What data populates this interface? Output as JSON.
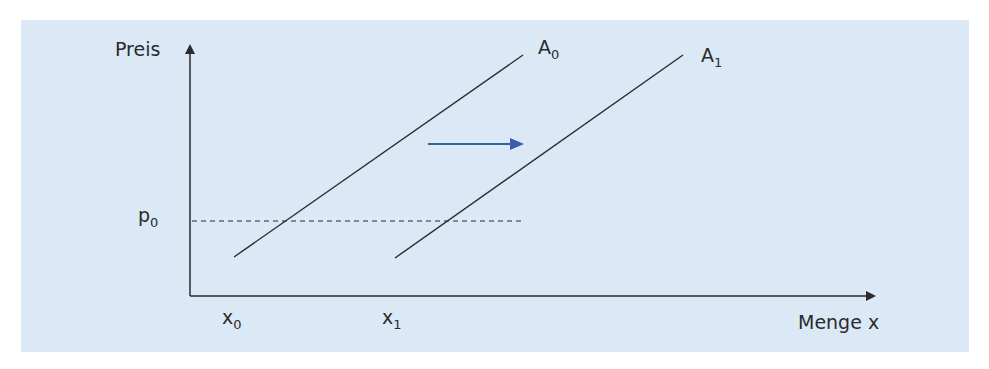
{
  "diagram": {
    "type": "supply-shift",
    "background_color": "#dbe8f6",
    "line_color": "#2b2b2b",
    "shift_arrow_color": "#3a5ea8",
    "y_axis": {
      "label": "Preis"
    },
    "x_axis": {
      "label": "Menge x"
    },
    "price_level": {
      "symbol": "p",
      "subscript": "0"
    },
    "quantity_marks": [
      {
        "symbol": "x",
        "subscript": "0"
      },
      {
        "symbol": "x",
        "subscript": "1"
      }
    ],
    "curves": [
      {
        "symbol": "A",
        "subscript": "0",
        "role": "original supply"
      },
      {
        "symbol": "A",
        "subscript": "1",
        "role": "shifted supply"
      }
    ],
    "shift_direction": "right"
  }
}
